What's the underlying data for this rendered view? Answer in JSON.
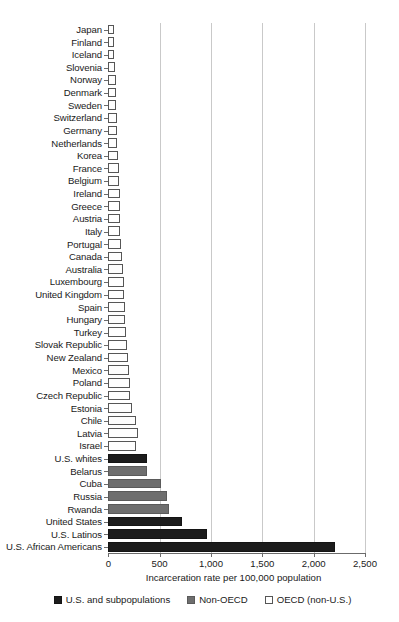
{
  "chart_data": {
    "type": "bar",
    "orientation": "horizontal",
    "title": "",
    "xlabel": "Incarceration rate per 100,000 population",
    "ylabel": "",
    "xlim": [
      0,
      2500
    ],
    "xticks": [
      0,
      500,
      1000,
      1500,
      2000,
      2500
    ],
    "xticklabels": [
      "0",
      "500",
      "1,000",
      "1,500",
      "2,000",
      "2,500"
    ],
    "grid": "vertical",
    "legend_position": "bottom",
    "categories": [
      "Japan",
      "Finland",
      "Iceland",
      "Slovenia",
      "Norway",
      "Denmark",
      "Sweden",
      "Switzerland",
      "Germany",
      "Netherlands",
      "Korea",
      "France",
      "Belgium",
      "Ireland",
      "Greece",
      "Austria",
      "Italy",
      "Portugal",
      "Canada",
      "Australia",
      "Luxembourg",
      "United Kingdom",
      "Spain",
      "Hungary",
      "Turkey",
      "Slovak Republic",
      "New Zealand",
      "Mexico",
      "Poland",
      "Czech Republic",
      "Estonia",
      "Chile",
      "Latvia",
      "Israel",
      "U.S. whites",
      "Belarus",
      "Cuba",
      "Russia",
      "Rwanda",
      "United States",
      "U.S. Latinos",
      "U.S. African Americans"
    ],
    "values": [
      51,
      58,
      60,
      66,
      72,
      73,
      78,
      82,
      83,
      87,
      99,
      101,
      108,
      112,
      114,
      115,
      116,
      127,
      129,
      143,
      151,
      152,
      159,
      163,
      170,
      183,
      192,
      198,
      208,
      212,
      235,
      266,
      291,
      265,
      380,
      381,
      510,
      568,
      595,
      716,
      966,
      2207
    ],
    "groups": [
      "OECD",
      "OECD",
      "OECD",
      "OECD",
      "OECD",
      "OECD",
      "OECD",
      "OECD",
      "OECD",
      "OECD",
      "OECD",
      "OECD",
      "OECD",
      "OECD",
      "OECD",
      "OECD",
      "OECD",
      "OECD",
      "OECD",
      "OECD",
      "OECD",
      "OECD",
      "OECD",
      "OECD",
      "OECD",
      "OECD",
      "OECD",
      "OECD",
      "OECD",
      "OECD",
      "OECD",
      "OECD",
      "OECD",
      "OECD",
      "US",
      "Non-OECD",
      "Non-OECD",
      "Non-OECD",
      "Non-OECD",
      "US",
      "US",
      "US"
    ],
    "series": [
      {
        "name": "U.S. and subpopulations",
        "color": "#1c1c1c"
      },
      {
        "name": "Non-OECD",
        "color": "#6e6e6e"
      },
      {
        "name": "OECD (non-U.S.)",
        "color": "#ffffff"
      }
    ]
  },
  "legend": {
    "items": [
      {
        "label": "U.S. and subpopulations",
        "swatch": "us"
      },
      {
        "label": "Non-OECD",
        "swatch": "nonoecd"
      },
      {
        "label": "OECD (non-U.S.)",
        "swatch": "oecd"
      }
    ]
  }
}
